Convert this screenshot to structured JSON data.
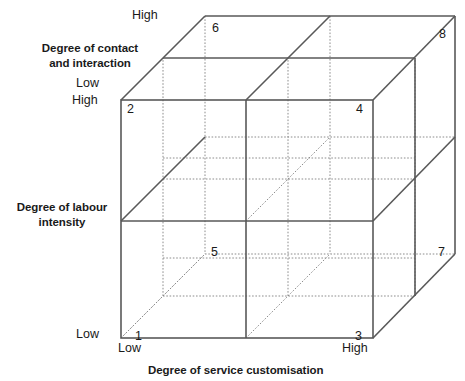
{
  "figure": {
    "type": "3d-cube-matrix"
  },
  "axes": {
    "contact": {
      "title": "Degree of contact\nand interaction",
      "title_line1": "Degree of contact",
      "title_line2": "and interaction",
      "low_label": "Low",
      "high_label": "High"
    },
    "labour": {
      "title": "Degree of labour\nintensity",
      "title_line1": "Degree of labour",
      "title_line2": "intensity",
      "low_label": "Low",
      "high_label": "High"
    },
    "customisation": {
      "title": "Degree of service customisation",
      "low_label": "Low",
      "high_label": "High"
    }
  },
  "vertices": [
    {
      "id": "1",
      "label": "1",
      "x": 135,
      "y": 329,
      "position": "front-bottom-left"
    },
    {
      "id": "2",
      "label": "2",
      "x": 127,
      "y": 102,
      "position": "front-top-left"
    },
    {
      "id": "3",
      "label": "3",
      "x": 355,
      "y": 329,
      "position": "front-bottom-right"
    },
    {
      "id": "4",
      "label": "4",
      "x": 356,
      "y": 102,
      "position": "front-top-right"
    },
    {
      "id": "5",
      "label": "5",
      "x": 211,
      "y": 245,
      "position": "back-bottom-left"
    },
    {
      "id": "6",
      "label": "6",
      "x": 212,
      "y": 21,
      "position": "back-top-left"
    },
    {
      "id": "7",
      "label": "7",
      "x": 438,
      "y": 245,
      "position": "back-bottom-right"
    },
    {
      "id": "8",
      "label": "8",
      "x": 439,
      "y": 27,
      "position": "back-top-right"
    }
  ],
  "geometry": {
    "front_top_left": [
      121,
      100
    ],
    "front_top_right": [
      373,
      100
    ],
    "front_bottom_left": [
      121,
      338
    ],
    "front_bottom_right": [
      373,
      338
    ],
    "back_top_left": [
      205,
      16
    ],
    "back_top_right": [
      455,
      16
    ],
    "back_bottom_left": [
      205,
      254
    ],
    "back_bottom_right": [
      455,
      254
    ],
    "mid_x_front": 246,
    "mid_y_front": 221,
    "depth_offset_x": 84,
    "depth_offset_y": -84
  },
  "colors": {
    "solid_line": "#595959",
    "dotted_line": "#8c8c8c",
    "text": "#1a1a1a",
    "background": "#ffffff"
  }
}
